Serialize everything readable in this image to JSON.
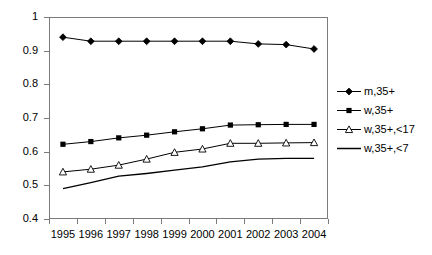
{
  "chart_data": {
    "type": "line",
    "title": "",
    "xlabel": "",
    "ylabel": "",
    "categories": [
      "1995",
      "1996",
      "1997",
      "1998",
      "1999",
      "2000",
      "2001",
      "2002",
      "2003",
      "2004"
    ],
    "ylim": [
      0.4,
      1.0
    ],
    "yticks": [
      "0.4",
      "0.5",
      "0.6",
      "0.7",
      "0.8",
      "0.9",
      "1"
    ],
    "ytick_values": [
      0.4,
      0.5,
      0.6,
      0.7,
      0.8,
      0.9,
      1.0
    ],
    "grid": false,
    "legend_position": "right",
    "series": [
      {
        "name": "m,35+",
        "marker": "filled-diamond",
        "color": "#000000",
        "values": [
          0.94,
          0.928,
          0.928,
          0.928,
          0.928,
          0.928,
          0.928,
          0.92,
          0.918,
          0.905
        ]
      },
      {
        "name": "w,35+",
        "marker": "filled-square",
        "color": "#000000",
        "values": [
          0.622,
          0.63,
          0.641,
          0.649,
          0.659,
          0.668,
          0.679,
          0.68,
          0.681,
          0.681
        ]
      },
      {
        "name": "w,35+,<17",
        "marker": "open-triangle",
        "color": "#000000",
        "values": [
          0.54,
          0.548,
          0.56,
          0.578,
          0.598,
          0.608,
          0.625,
          0.625,
          0.626,
          0.627
        ]
      },
      {
        "name": "w,35+,<7",
        "marker": "none",
        "color": "#000000",
        "values": [
          0.49,
          0.508,
          0.527,
          0.535,
          0.545,
          0.555,
          0.57,
          0.578,
          0.58,
          0.58
        ]
      }
    ]
  },
  "legend": {
    "items": [
      {
        "label": "m,35+"
      },
      {
        "label": "w,35+"
      },
      {
        "label": "w,35+,<17"
      },
      {
        "label": "w,35+,<7"
      }
    ]
  },
  "colors": {
    "axis": "#7b7b7b",
    "series": "#000000",
    "background": "#ffffff"
  }
}
